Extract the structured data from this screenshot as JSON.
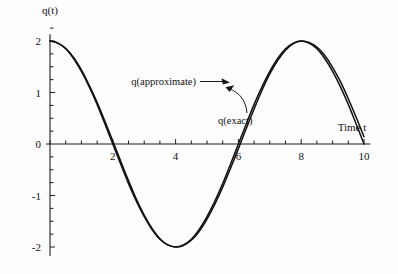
{
  "figure": {
    "background_color": "#fdfdfd",
    "ink_color": "#111111"
  },
  "chart_data": {
    "type": "line",
    "title": "",
    "xlabel": "Time t",
    "ylabel": "q(t)",
    "xlim": [
      0,
      10.2
    ],
    "ylim": [
      -2.25,
      2.25
    ],
    "grid": false,
    "legend_position": "inline-annotations",
    "x_ticks_major": [
      2,
      4,
      6,
      8,
      10
    ],
    "x_ticks_minor_step": 0.5,
    "y_ticks_major": [
      2,
      1,
      0,
      -1,
      -2
    ],
    "y_ticks_minor_step": 0.25,
    "x_tick_labels": [
      "2",
      "4",
      "6",
      "8",
      "10"
    ],
    "y_tick_labels": [
      "2",
      "1",
      "0",
      "-1",
      "-2"
    ],
    "annotations": [
      {
        "text": "q(approximate)",
        "arrow": "straight",
        "points_to_x": 5.6,
        "points_to_y": 1.35
      },
      {
        "text": "q(exact)",
        "arrow": "curved",
        "points_to_x": 5.75,
        "points_to_y": 1.05
      }
    ],
    "series": [
      {
        "name": "q(exact)",
        "x": [
          0,
          0.25,
          0.5,
          0.75,
          1,
          1.25,
          1.5,
          1.75,
          2,
          2.25,
          2.5,
          2.75,
          3,
          3.25,
          3.5,
          3.75,
          4,
          4.25,
          4.5,
          4.75,
          5,
          5.25,
          5.5,
          5.75,
          6,
          6.25,
          6.5,
          6.75,
          7,
          7.25,
          7.5,
          7.75,
          8,
          8.25,
          8.5,
          8.75,
          9,
          9.25,
          9.5,
          9.75,
          10
        ],
        "values": [
          2,
          1.96,
          1.85,
          1.66,
          1.41,
          1.11,
          0.77,
          0.39,
          0.0,
          -0.39,
          -0.77,
          -1.11,
          -1.41,
          -1.66,
          -1.85,
          -1.96,
          -2.0,
          -1.96,
          -1.85,
          -1.66,
          -1.41,
          -1.11,
          -0.77,
          -0.39,
          0.0,
          0.39,
          0.77,
          1.11,
          1.41,
          1.66,
          1.85,
          1.96,
          2.0,
          1.96,
          1.85,
          1.66,
          1.41,
          1.11,
          0.77,
          0.39,
          0.0
        ]
      },
      {
        "name": "q(approximate)",
        "x": [
          0,
          0.25,
          0.5,
          0.75,
          1,
          1.25,
          1.5,
          1.75,
          2,
          2.25,
          2.5,
          2.75,
          3,
          3.25,
          3.5,
          3.75,
          4,
          4.25,
          4.5,
          4.75,
          5,
          5.25,
          5.5,
          5.75,
          6,
          6.25,
          6.5,
          6.75,
          7,
          7.25,
          7.5,
          7.75,
          8,
          8.25,
          8.5,
          8.75,
          9,
          9.25,
          9.5,
          9.75,
          10
        ],
        "values": [
          2,
          1.96,
          1.86,
          1.68,
          1.44,
          1.14,
          0.81,
          0.44,
          0.06,
          -0.33,
          -0.71,
          -1.07,
          -1.38,
          -1.64,
          -1.84,
          -1.96,
          -2.0,
          -1.97,
          -1.87,
          -1.7,
          -1.46,
          -1.17,
          -0.84,
          -0.47,
          -0.09,
          0.3,
          0.68,
          1.04,
          1.36,
          1.62,
          1.82,
          1.95,
          2.0,
          1.97,
          1.88,
          1.72,
          1.49,
          1.21,
          0.88,
          0.52,
          0.14
        ]
      }
    ]
  }
}
